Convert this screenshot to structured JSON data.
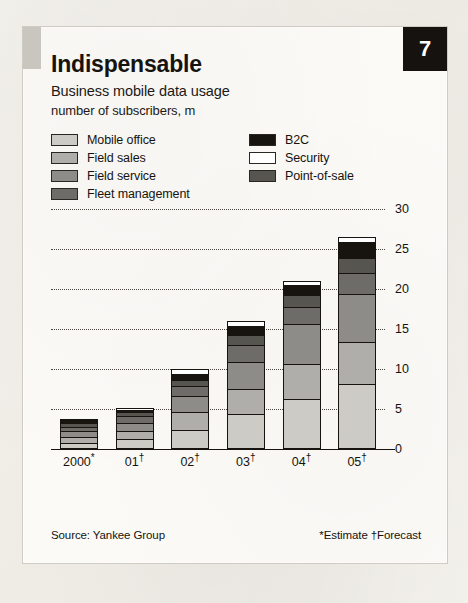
{
  "page_number": "7",
  "header": {
    "title": "Indispensable",
    "subtitle": "Business mobile data usage",
    "units": "number of subscribers, m"
  },
  "footer": {
    "source": "Source: Yankee Group",
    "notes": "*Estimate  †Forecast"
  },
  "legend": {
    "left_column": [
      {
        "label": "Mobile office",
        "color": "#cdcbc6"
      },
      {
        "label": "Field sales",
        "color": "#b0aeaa"
      },
      {
        "label": "Field service",
        "color": "#8e8c88"
      },
      {
        "label": "Fleet management",
        "color": "#6e6c69"
      }
    ],
    "right_column": [
      {
        "label": "B2C",
        "color": "#17140f"
      },
      {
        "label": "Security",
        "color": "#ffffff"
      },
      {
        "label": "Point-of-sale",
        "color": "#57554f"
      }
    ]
  },
  "chart_data": {
    "type": "bar",
    "stacked": true,
    "title": "Indispensable",
    "subtitle": "Business mobile data usage",
    "xlabel": "",
    "ylabel": "number of subscribers, m",
    "ylim": [
      0,
      30
    ],
    "yticks": [
      0,
      5,
      10,
      15,
      20,
      25,
      30
    ],
    "ytick_labels": [
      "0",
      "5",
      "10",
      "15",
      "20",
      "25",
      "30"
    ],
    "grid": true,
    "grid_style": "dotted",
    "legend_position": "top",
    "categories": [
      "2000*",
      "01†",
      "02†",
      "03†",
      "04†",
      "05†"
    ],
    "category_labels": [
      {
        "base": "2000",
        "mark": "*"
      },
      {
        "base": "01",
        "mark": "†"
      },
      {
        "base": "02",
        "mark": "†"
      },
      {
        "base": "03",
        "mark": "†"
      },
      {
        "base": "04",
        "mark": "†"
      },
      {
        "base": "05",
        "mark": "†"
      }
    ],
    "series": [
      {
        "name": "Mobile office",
        "color": "#cdcbc6",
        "values": [
          0.8,
          1.2,
          2.4,
          4.4,
          6.2,
          8.1
        ]
      },
      {
        "name": "Field sales",
        "color": "#b0aeaa",
        "values": [
          0.7,
          1.1,
          2.2,
          3.1,
          4.4,
          5.3
        ]
      },
      {
        "name": "Field service",
        "color": "#8e8c88",
        "values": [
          0.7,
          1.0,
          2.0,
          3.4,
          5.0,
          6.0
        ]
      },
      {
        "name": "Fleet management",
        "color": "#6e6c69",
        "values": [
          0.6,
          0.8,
          1.3,
          2.1,
          2.2,
          2.6
        ]
      },
      {
        "name": "Point-of-sale",
        "color": "#57554f",
        "values": [
          0.5,
          0.5,
          0.7,
          1.2,
          1.4,
          1.9
        ]
      },
      {
        "name": "B2C",
        "color": "#17140f",
        "values": [
          0.3,
          0.3,
          0.8,
          1.2,
          1.3,
          2.0
        ]
      },
      {
        "name": "Security",
        "color": "#ffffff",
        "values": [
          0.2,
          0.2,
          0.6,
          0.6,
          0.5,
          0.6
        ]
      }
    ],
    "totals": [
      3.8,
      5.1,
      10.0,
      16.0,
      21.0,
      26.5
    ]
  }
}
